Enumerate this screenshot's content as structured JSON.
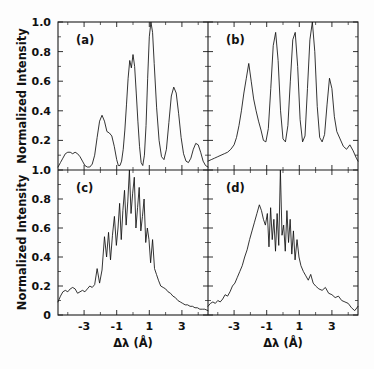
{
  "figure": {
    "ylabel": "Normalized Intensity",
    "xlabel": "Δλ (Å)",
    "trace_color": "#101010",
    "axis_color": "#1a1a1a",
    "background": "#fdfdfd"
  },
  "panels": {
    "a": {
      "label": "(a)"
    },
    "b": {
      "label": "(b)"
    },
    "c": {
      "label": "(c)"
    },
    "d": {
      "label": "(d)"
    }
  },
  "axes": {
    "x_ticks": [
      "-3",
      "-1",
      "1",
      "3"
    ],
    "x_tick_values": [
      -3,
      -1,
      1,
      3
    ],
    "x_minor_values": [
      -4,
      -2,
      0,
      2,
      4
    ],
    "y_ticks_top": [
      "1.0",
      "0.8",
      "0.6",
      "0.4",
      "0.2"
    ],
    "y_tick_values_top": [
      1.0,
      0.8,
      0.6,
      0.4,
      0.2
    ],
    "y_ticks_bottom": [
      "1.0",
      "0.8",
      "0.6",
      "0.4",
      "0.2",
      "0"
    ],
    "y_tick_values_bottom": [
      1.0,
      0.8,
      0.6,
      0.4,
      0.2,
      0
    ],
    "xlim": [
      -4.6,
      4.6
    ],
    "ylim": [
      0,
      1.0
    ],
    "grid": false
  },
  "chart_data": {
    "type": "line",
    "title": "",
    "xlabel": "Δλ (Å)",
    "ylabel": "Normalized Intensity",
    "xlim": [
      -4.6,
      4.6
    ],
    "ylim": [
      0,
      1.0
    ],
    "grid": false,
    "legend": "none",
    "panel_layout": "2x2",
    "annotations": [
      "(a)",
      "(b)",
      "(c)",
      "(d)"
    ],
    "series": [
      {
        "name": "(a)",
        "panel": "a",
        "x": [
          -4.6,
          -4.45,
          -4.3,
          -4.15,
          -4.0,
          -3.85,
          -3.7,
          -3.55,
          -3.4,
          -3.25,
          -3.1,
          -2.95,
          -2.8,
          -2.65,
          -2.5,
          -2.35,
          -2.2,
          -2.05,
          -1.9,
          -1.75,
          -1.6,
          -1.45,
          -1.3,
          -1.15,
          -1.0,
          -0.9,
          -0.8,
          -0.7,
          -0.6,
          -0.5,
          -0.4,
          -0.3,
          -0.2,
          -0.1,
          0.0,
          0.1,
          0.2,
          0.3,
          0.4,
          0.5,
          0.6,
          0.7,
          0.8,
          0.9,
          1.0,
          1.1,
          1.2,
          1.3,
          1.45,
          1.6,
          1.75,
          1.9,
          2.05,
          2.2,
          2.35,
          2.5,
          2.65,
          2.8,
          2.95,
          3.1,
          3.25,
          3.4,
          3.55,
          3.7,
          3.85,
          4.0,
          4.15,
          4.3,
          4.45,
          4.6
        ],
        "y": [
          0.02,
          0.05,
          0.08,
          0.11,
          0.12,
          0.12,
          0.11,
          0.12,
          0.11,
          0.09,
          0.06,
          0.03,
          0.02,
          0.02,
          0.04,
          0.1,
          0.22,
          0.33,
          0.37,
          0.33,
          0.26,
          0.25,
          0.23,
          0.16,
          0.07,
          0.03,
          0.03,
          0.06,
          0.14,
          0.27,
          0.44,
          0.62,
          0.74,
          0.69,
          0.78,
          0.7,
          0.52,
          0.33,
          0.16,
          0.05,
          0.03,
          0.1,
          0.3,
          0.62,
          0.9,
          1.0,
          0.93,
          0.72,
          0.42,
          0.2,
          0.09,
          0.07,
          0.14,
          0.32,
          0.5,
          0.56,
          0.52,
          0.38,
          0.22,
          0.11,
          0.06,
          0.05,
          0.08,
          0.14,
          0.18,
          0.17,
          0.12,
          0.06,
          0.03,
          0.02
        ]
      },
      {
        "name": "(b)",
        "panel": "b",
        "x": [
          -4.6,
          -4.4,
          -4.2,
          -4.0,
          -3.8,
          -3.6,
          -3.4,
          -3.2,
          -3.0,
          -2.85,
          -2.7,
          -2.55,
          -2.4,
          -2.25,
          -2.1,
          -1.95,
          -1.8,
          -1.65,
          -1.5,
          -1.35,
          -1.2,
          -1.05,
          -0.9,
          -0.75,
          -0.6,
          -0.45,
          -0.3,
          -0.15,
          0.0,
          0.15,
          0.3,
          0.45,
          0.6,
          0.75,
          0.9,
          1.05,
          1.2,
          1.35,
          1.5,
          1.65,
          1.8,
          1.95,
          2.1,
          2.25,
          2.4,
          2.55,
          2.7,
          2.85,
          3.0,
          3.15,
          3.3,
          3.5,
          3.7,
          3.9,
          4.1,
          4.3,
          4.5,
          4.6
        ],
        "y": [
          0.06,
          0.07,
          0.08,
          0.09,
          0.1,
          0.11,
          0.12,
          0.14,
          0.17,
          0.22,
          0.3,
          0.4,
          0.52,
          0.62,
          0.72,
          0.6,
          0.48,
          0.4,
          0.33,
          0.27,
          0.2,
          0.19,
          0.28,
          0.55,
          0.84,
          0.93,
          0.74,
          0.4,
          0.21,
          0.19,
          0.3,
          0.6,
          0.88,
          0.93,
          0.7,
          0.34,
          0.19,
          0.23,
          0.55,
          0.88,
          1.0,
          0.8,
          0.43,
          0.22,
          0.19,
          0.24,
          0.44,
          0.62,
          0.55,
          0.36,
          0.26,
          0.21,
          0.16,
          0.14,
          0.17,
          0.13,
          0.08,
          0.06
        ]
      },
      {
        "name": "(c)",
        "panel": "c",
        "x": [
          -4.6,
          -4.45,
          -4.3,
          -4.15,
          -4.0,
          -3.85,
          -3.7,
          -3.55,
          -3.4,
          -3.25,
          -3.1,
          -2.95,
          -2.8,
          -2.65,
          -2.5,
          -2.35,
          -2.2,
          -2.05,
          -1.9,
          -1.75,
          -1.62,
          -1.5,
          -1.38,
          -1.26,
          -1.14,
          -1.02,
          -0.92,
          -0.82,
          -0.72,
          -0.62,
          -0.52,
          -0.42,
          -0.32,
          -0.22,
          -0.12,
          -0.02,
          0.08,
          0.18,
          0.28,
          0.38,
          0.48,
          0.58,
          0.68,
          0.78,
          0.88,
          0.98,
          1.08,
          1.2,
          1.32,
          1.44,
          1.56,
          1.7,
          1.85,
          2.0,
          2.15,
          2.3,
          2.45,
          2.6,
          2.75,
          2.9,
          3.05,
          3.2,
          3.35,
          3.5,
          3.65,
          3.8,
          3.95,
          4.1,
          4.25,
          4.4,
          4.6
        ],
        "y": [
          0.09,
          0.13,
          0.16,
          0.17,
          0.16,
          0.18,
          0.19,
          0.18,
          0.15,
          0.16,
          0.17,
          0.16,
          0.18,
          0.2,
          0.19,
          0.21,
          0.32,
          0.22,
          0.31,
          0.54,
          0.4,
          0.57,
          0.38,
          0.55,
          0.68,
          0.48,
          0.6,
          0.77,
          0.52,
          0.72,
          0.86,
          0.62,
          0.78,
          1.0,
          0.7,
          0.84,
          0.95,
          0.6,
          0.74,
          0.88,
          0.58,
          0.68,
          0.8,
          0.5,
          0.6,
          0.52,
          0.36,
          0.52,
          0.32,
          0.28,
          0.24,
          0.2,
          0.19,
          0.18,
          0.16,
          0.15,
          0.13,
          0.12,
          0.1,
          0.09,
          0.08,
          0.07,
          0.07,
          0.06,
          0.06,
          0.05,
          0.05,
          0.04,
          0.04,
          0.04,
          0.03
        ]
      },
      {
        "name": "(d)",
        "panel": "d",
        "x": [
          -4.6,
          -4.45,
          -4.3,
          -4.15,
          -4.0,
          -3.85,
          -3.7,
          -3.55,
          -3.4,
          -3.25,
          -3.1,
          -2.95,
          -2.8,
          -2.65,
          -2.5,
          -2.35,
          -2.2,
          -2.05,
          -1.9,
          -1.75,
          -1.6,
          -1.45,
          -1.32,
          -1.2,
          -1.08,
          -0.96,
          -0.86,
          -0.76,
          -0.66,
          -0.56,
          -0.46,
          -0.36,
          -0.26,
          -0.16,
          -0.06,
          0.04,
          0.14,
          0.24,
          0.34,
          0.44,
          0.54,
          0.64,
          0.74,
          0.86,
          0.98,
          1.1,
          1.25,
          1.4,
          1.55,
          1.7,
          1.85,
          2.0,
          2.2,
          2.4,
          2.6,
          2.8,
          3.0,
          3.2,
          3.4,
          3.6,
          3.8,
          4.0,
          4.2,
          4.4,
          4.6
        ],
        "y": [
          0.06,
          0.08,
          0.09,
          0.08,
          0.1,
          0.09,
          0.11,
          0.14,
          0.13,
          0.16,
          0.2,
          0.22,
          0.26,
          0.3,
          0.34,
          0.4,
          0.45,
          0.52,
          0.58,
          0.64,
          0.7,
          0.76,
          0.72,
          0.66,
          0.62,
          0.7,
          0.47,
          0.74,
          0.52,
          0.66,
          0.44,
          0.7,
          0.48,
          1.0,
          0.55,
          0.62,
          0.44,
          0.72,
          0.5,
          0.66,
          0.42,
          0.58,
          0.38,
          0.52,
          0.4,
          0.34,
          0.3,
          0.27,
          0.24,
          0.28,
          0.22,
          0.2,
          0.18,
          0.17,
          0.19,
          0.15,
          0.14,
          0.12,
          0.13,
          0.1,
          0.09,
          0.08,
          0.05,
          0.03,
          0.06
        ]
      }
    ]
  }
}
